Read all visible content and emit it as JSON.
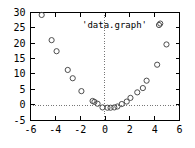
{
  "chart_data": {
    "type": "scatter",
    "title": "",
    "legend_entries": [
      "'data.graph'"
    ],
    "legend_position": "top-right-inside",
    "legend_marker": "open-circle",
    "xlabel": "",
    "ylabel": "",
    "xlim": [
      -6,
      6
    ],
    "ylim": [
      -5,
      30
    ],
    "xticks": [
      -6,
      -4,
      -2,
      0,
      2,
      4,
      6
    ],
    "xtick_labels": [
      "-6",
      "-4",
      "-2",
      "0",
      "2",
      "4",
      "6"
    ],
    "yticks": [
      -5,
      0,
      5,
      10,
      15,
      20,
      25,
      30
    ],
    "ytick_labels": [
      "-5",
      "0",
      "5",
      "10",
      "15",
      "20",
      "25",
      "30"
    ],
    "grid": "zero-lines-dotted",
    "marker_style": "open-circle",
    "series": [
      {
        "name": "'data.graph'",
        "points": [
          {
            "x": -5.1,
            "y": 29.2
          },
          {
            "x": -4.3,
            "y": 21.0
          },
          {
            "x": -3.9,
            "y": 17.4
          },
          {
            "x": -3.0,
            "y": 11.3
          },
          {
            "x": -2.6,
            "y": 8.6
          },
          {
            "x": -1.9,
            "y": 4.4
          },
          {
            "x": -1.0,
            "y": 1.2
          },
          {
            "x": -0.85,
            "y": 0.9
          },
          {
            "x": -0.6,
            "y": 0.3
          },
          {
            "x": -0.2,
            "y": -0.9
          },
          {
            "x": 0.2,
            "y": -1.0
          },
          {
            "x": 0.45,
            "y": -1.0
          },
          {
            "x": 0.75,
            "y": -0.9
          },
          {
            "x": 1.0,
            "y": -0.6
          },
          {
            "x": 1.35,
            "y": 0.2
          },
          {
            "x": 1.75,
            "y": 1.0
          },
          {
            "x": 2.05,
            "y": 2.2
          },
          {
            "x": 2.6,
            "y": 4.0
          },
          {
            "x": 3.05,
            "y": 5.4
          },
          {
            "x": 3.35,
            "y": 7.8
          },
          {
            "x": 4.2,
            "y": 13.0
          },
          {
            "x": 4.45,
            "y": 26.4
          },
          {
            "x": 4.95,
            "y": 19.6
          }
        ]
      }
    ]
  },
  "axes": {
    "y_labels": [
      "30",
      "25",
      "20",
      "15",
      "10",
      "5",
      "0",
      "-5"
    ],
    "x_labels": [
      "-6",
      "-4",
      "-2",
      "0",
      "2",
      "4",
      "6"
    ]
  },
  "key": {
    "label": "'data.graph'"
  }
}
